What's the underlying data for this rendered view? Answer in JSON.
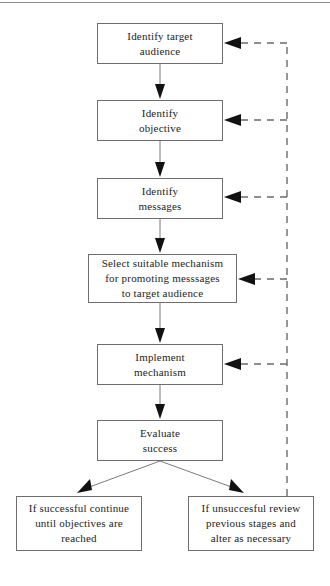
{
  "diagram": {
    "type": "flowchart",
    "orientation": "top-to-bottom",
    "colors": {
      "box_border": "#6e6e6e",
      "box_fill": "#ffffff",
      "solid_connector": "#7a7a7a",
      "dashed_connector": "#6b6b6b",
      "arrow_head": "#111111",
      "text": "#232323",
      "top_rule": "#8c8c8c"
    },
    "nodes": [
      {
        "id": "identify-target-audience",
        "lines": [
          "Identify target",
          "audience"
        ],
        "line1": "Identify target",
        "line2": "audience",
        "line3": ""
      },
      {
        "id": "identify-objective",
        "lines": [
          "Identify",
          "objective"
        ],
        "line1": "Identify",
        "line2": "objective",
        "line3": ""
      },
      {
        "id": "identify-messages",
        "lines": [
          "Identify",
          "messages"
        ],
        "line1": "Identify",
        "line2": "messages",
        "line3": ""
      },
      {
        "id": "select-suitable-mechanism",
        "lines": [
          "Select suitable mechanism",
          "for promoting messsages",
          "to target audience"
        ],
        "line1": "Select suitable mechanism",
        "line2": "for promoting messsages",
        "line3": "to target audience"
      },
      {
        "id": "implement-mechanism",
        "lines": [
          "Implement",
          "mechanism"
        ],
        "line1": "Implement",
        "line2": "mechanism",
        "line3": ""
      },
      {
        "id": "evaluate-success",
        "lines": [
          "Evaluate",
          "success"
        ],
        "line1": "Evaluate",
        "line2": "success",
        "line3": ""
      },
      {
        "id": "if-successful",
        "lines": [
          "If successful continue",
          "until objectives are",
          "reached"
        ],
        "line1": "If successful continue",
        "line2": "until objectives are",
        "line3": "reached"
      },
      {
        "id": "if-unsuccessful",
        "lines": [
          "If unsuccesful review",
          "previous stages and",
          "alter as necessary"
        ],
        "line1": "If unsuccesful review",
        "line2": "previous stages and",
        "line3": "alter as necessary"
      }
    ],
    "edges": [
      {
        "from": "identify-target-audience",
        "to": "identify-objective",
        "style": "solid"
      },
      {
        "from": "identify-objective",
        "to": "identify-messages",
        "style": "solid"
      },
      {
        "from": "identify-messages",
        "to": "select-suitable-mechanism",
        "style": "solid"
      },
      {
        "from": "select-suitable-mechanism",
        "to": "implement-mechanism",
        "style": "solid"
      },
      {
        "from": "implement-mechanism",
        "to": "evaluate-success",
        "style": "solid"
      },
      {
        "from": "evaluate-success",
        "to": "if-successful",
        "style": "solid"
      },
      {
        "from": "evaluate-success",
        "to": "if-unsuccessful",
        "style": "solid"
      },
      {
        "from": "if-unsuccessful",
        "to": "identify-target-audience",
        "style": "dashed"
      },
      {
        "from": "if-unsuccessful",
        "to": "identify-objective",
        "style": "dashed"
      },
      {
        "from": "if-unsuccessful",
        "to": "identify-messages",
        "style": "dashed"
      },
      {
        "from": "if-unsuccessful",
        "to": "select-suitable-mechanism",
        "style": "dashed"
      },
      {
        "from": "if-unsuccessful",
        "to": "implement-mechanism",
        "style": "dashed"
      }
    ]
  }
}
